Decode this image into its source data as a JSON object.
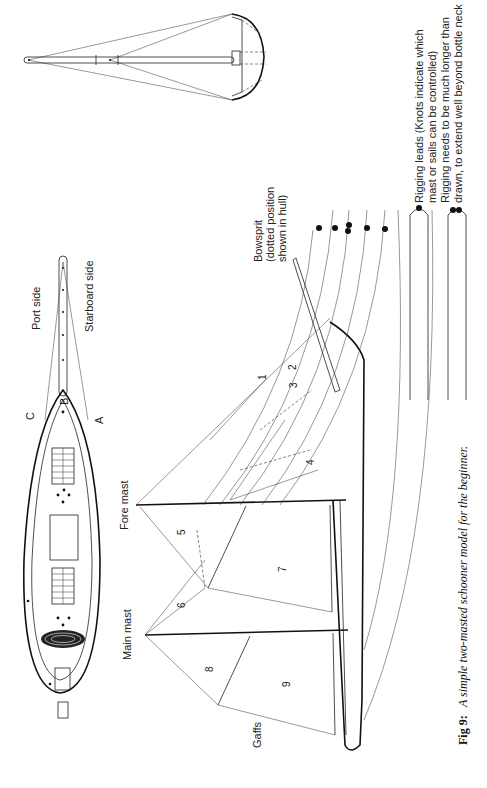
{
  "figure": {
    "caption_label": "Fig 9:",
    "caption_text": "A simple two-masted schooner model for the beginner."
  },
  "deck_plan": {
    "port_side": "Port side",
    "starboard_side": "Starboard side",
    "point_a": "A",
    "point_b": "B",
    "point_c": "C"
  },
  "side_view": {
    "fore_mast": "Fore mast",
    "main_mast": "Main mast",
    "gaffs": "Gaffs",
    "bowsprit_line1": "Bowsprit",
    "bowsprit_line2": "(dotted position",
    "bowsprit_line3": "shown in hull)",
    "sails": [
      "1",
      "2",
      "3",
      "4",
      "5",
      "6",
      "7",
      "8",
      "9"
    ]
  },
  "legend": {
    "leads_line1": "Rigging leads (Knots indicate which",
    "leads_line2": "mast or sails can be controlled)",
    "length_line1": "Rigging needs to be much longer than",
    "length_line2": "drawn, to extend well beyond bottle neck"
  }
}
